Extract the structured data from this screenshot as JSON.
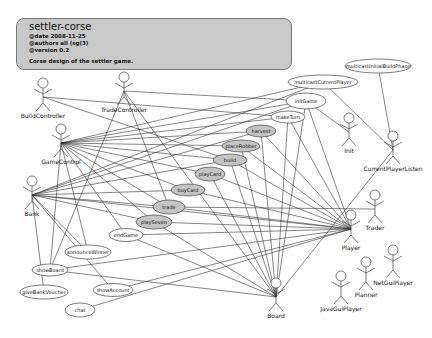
{
  "note": {
    "title": "settler-corse",
    "date": "@date 2008-11-25",
    "authors": "@authors all (sg(3)",
    "version": "@version 0.2",
    "description": "Corse design of the settler game."
  },
  "actors": [
    {
      "id": "BuildController",
      "label": "BuildController",
      "x": 43,
      "y": 83
    },
    {
      "id": "TradeController",
      "label": "TradeController",
      "x": 124,
      "y": 77
    },
    {
      "id": "GameControl",
      "label": "GameControl",
      "x": 61,
      "y": 129
    },
    {
      "id": "Bank",
      "label": "Bank",
      "x": 32,
      "y": 181
    },
    {
      "id": "Init",
      "label": "Init",
      "x": 349,
      "y": 118
    },
    {
      "id": "CurrentPlayerListen",
      "label": "CurrentPlayerListen",
      "x": 393,
      "y": 136
    },
    {
      "id": "Trader",
      "label": "Trader",
      "x": 375,
      "y": 195
    },
    {
      "id": "Player",
      "label": "Player",
      "x": 351,
      "y": 215
    },
    {
      "id": "NetGuiPlayer",
      "label": "NetGuiPlayer",
      "x": 393,
      "y": 250
    },
    {
      "id": "Planner",
      "label": "Planner",
      "x": 366,
      "y": 262
    },
    {
      "id": "JavaGuiPlayer",
      "label": "JavaGuiPlayer",
      "x": 341,
      "y": 276
    },
    {
      "id": "Board",
      "label": "Board",
      "x": 276,
      "y": 283
    }
  ],
  "use_cases": [
    {
      "id": "multicastInitialBuildPhase",
      "label": "multicastInitialBuildPhase",
      "x": 378,
      "y": 66,
      "rx": 33,
      "ry": 7,
      "shaded": false
    },
    {
      "id": "multicastCurrentPlayer",
      "label": "multicastCurrentPlayer",
      "x": 323,
      "y": 82,
      "rx": 35,
      "ry": 7,
      "shaded": false
    },
    {
      "id": "initGame",
      "label": "initGame",
      "x": 306,
      "y": 101,
      "rx": 20,
      "ry": 8,
      "shaded": false
    },
    {
      "id": "makeTurn",
      "label": "makeTurn",
      "x": 288,
      "y": 117,
      "rx": 17,
      "ry": 6,
      "shaded": false
    },
    {
      "id": "harvest",
      "label": "harvest",
      "x": 261,
      "y": 131,
      "rx": 15,
      "ry": 6,
      "shaded": true
    },
    {
      "id": "placeRobber",
      "label": "placeRobber",
      "x": 241,
      "y": 146,
      "rx": 19,
      "ry": 6,
      "shaded": true
    },
    {
      "id": "build",
      "label": "build",
      "x": 230,
      "y": 160,
      "rx": 17,
      "ry": 6,
      "shaded": true
    },
    {
      "id": "playCard",
      "label": "playCard",
      "x": 210,
      "y": 174,
      "rx": 15,
      "ry": 7,
      "shaded": true
    },
    {
      "id": "buyCard",
      "label": "buyCard",
      "x": 188,
      "y": 190,
      "rx": 17,
      "ry": 6,
      "shaded": true
    },
    {
      "id": "trade",
      "label": "trade",
      "x": 169,
      "y": 207,
      "rx": 16,
      "ry": 7,
      "shaded": true
    },
    {
      "id": "playSeven",
      "label": "playSeven",
      "x": 154,
      "y": 222,
      "rx": 18,
      "ry": 7,
      "shaded": true
    },
    {
      "id": "endGame",
      "label": "endGame",
      "x": 126,
      "y": 235,
      "rx": 17,
      "ry": 6.5,
      "shaded": false
    },
    {
      "id": "announceWinner",
      "label": "announceWinner",
      "x": 88,
      "y": 252,
      "rx": 23,
      "ry": 7,
      "shaded": false
    },
    {
      "id": "showBoard",
      "label": "showBoard",
      "x": 50,
      "y": 270,
      "rx": 18,
      "ry": 6,
      "shaded": false
    },
    {
      "id": "giveBankVoucher",
      "label": "giveBankVoucher",
      "x": 44,
      "y": 292,
      "rx": 24,
      "ry": 7,
      "shaded": false
    },
    {
      "id": "showAccount",
      "label": "showAccount",
      "x": 113,
      "y": 290,
      "rx": 20,
      "ry": 6.5,
      "shaded": false
    },
    {
      "id": "chat",
      "label": "chat",
      "x": 80,
      "y": 310,
      "rx": 15,
      "ry": 7,
      "shaded": false
    }
  ],
  "associations": [
    [
      "BuildController",
      "makeTurn"
    ],
    [
      "BuildController",
      "build"
    ],
    [
      "TradeController",
      "initGame"
    ],
    [
      "TradeController",
      "trade"
    ],
    [
      "TradeController",
      "Board"
    ],
    [
      "TradeController",
      "showBoard"
    ],
    [
      "GameControl",
      "multicastCurrentPlayer"
    ],
    [
      "GameControl",
      "initGame"
    ],
    [
      "GameControl",
      "makeTurn"
    ],
    [
      "GameControl",
      "harvest"
    ],
    [
      "GameControl",
      "placeRobber"
    ],
    [
      "GameControl",
      "build"
    ],
    [
      "GameControl",
      "playCard"
    ],
    [
      "GameControl",
      "buyCard"
    ],
    [
      "GameControl",
      "trade"
    ],
    [
      "GameControl",
      "playSeven"
    ],
    [
      "GameControl",
      "endGame"
    ],
    [
      "GameControl",
      "announceWinner"
    ],
    [
      "GameControl",
      "showBoard"
    ],
    [
      "Bank",
      "multicastCurrentPlayer"
    ],
    [
      "Bank",
      "initGame"
    ],
    [
      "Bank",
      "harvest"
    ],
    [
      "Bank",
      "build"
    ],
    [
      "Bank",
      "buyCard"
    ],
    [
      "Bank",
      "trade"
    ],
    [
      "Bank",
      "playSeven"
    ],
    [
      "Bank",
      "showAccount"
    ],
    [
      "Bank",
      "giveBankVoucher"
    ],
    [
      "Bank",
      "Player"
    ],
    [
      "Bank",
      "announceWinner"
    ],
    [
      "Init",
      "initGame"
    ],
    [
      "CurrentPlayerListen",
      "multicastInitialBuildPhase"
    ],
    [
      "CurrentPlayerListen",
      "multicastCurrentPlayer"
    ],
    [
      "CurrentPlayerListen",
      "Board"
    ],
    [
      "Player",
      "initGame"
    ],
    [
      "Player",
      "makeTurn"
    ],
    [
      "Player",
      "harvest"
    ],
    [
      "Player",
      "placeRobber"
    ],
    [
      "Player",
      "build"
    ],
    [
      "Player",
      "playCard"
    ],
    [
      "Player",
      "buyCard"
    ],
    [
      "Player",
      "trade"
    ],
    [
      "Player",
      "playSeven"
    ],
    [
      "Player",
      "showBoard"
    ],
    [
      "Player",
      "showAccount"
    ],
    [
      "Player",
      "chat"
    ],
    [
      "Player",
      "endGame"
    ],
    [
      "Trader",
      "trade"
    ],
    [
      "Board",
      "initGame"
    ],
    [
      "Board",
      "makeTurn"
    ],
    [
      "Board",
      "harvest"
    ],
    [
      "Board",
      "placeRobber"
    ],
    [
      "Board",
      "build"
    ],
    [
      "Board",
      "playCard"
    ],
    [
      "Board",
      "playSeven"
    ],
    [
      "Board",
      "showBoard"
    ],
    [
      "Board",
      "endGame"
    ]
  ]
}
